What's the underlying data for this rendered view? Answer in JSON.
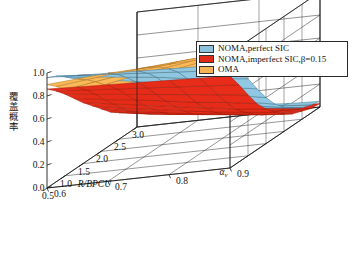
{
  "figure": {
    "background": "#ffffff",
    "axis_color": "#1a1a1a"
  },
  "legend": {
    "position": "top-right",
    "entries": [
      {
        "label": "NOMA,perfect SIC",
        "color": "#8cc2dc"
      },
      {
        "label": "NOMA,imperfect SIC,β=0.15",
        "color": "#e02b18"
      },
      {
        "label": "OMA",
        "color": "#f5b456"
      }
    ]
  },
  "axes": {
    "x": {
      "label": "R/BPCU",
      "ticks": [
        "0.5",
        "1.0",
        "1.5",
        "2.0",
        "2.5",
        "3.0"
      ],
      "values": [
        0.5,
        1.0,
        1.5,
        2.0,
        2.5,
        3.0
      ],
      "range": [
        0.5,
        3.0
      ]
    },
    "y": {
      "label": "α",
      "sublabel": "v",
      "ticks": [
        "0.6",
        "0.7",
        "0.8",
        "0.9"
      ],
      "values": [
        0.6,
        0.7,
        0.8,
        0.9
      ],
      "range": [
        0.6,
        0.9
      ]
    },
    "z": {
      "label": "覆盖概率",
      "ticks": [
        "0.0",
        "0.2",
        "0.4",
        "0.6",
        "0.8",
        "1.0"
      ],
      "values": [
        0.0,
        0.2,
        0.4,
        0.6,
        0.8,
        1.0
      ],
      "range": [
        0.0,
        1.0
      ]
    }
  },
  "chart_data": {
    "type": "surface3d",
    "title": "",
    "xlabel": "R/BPCU",
    "ylabel": "α_v",
    "zlabel": "覆盖概率",
    "xlim": [
      0.5,
      3.0
    ],
    "ylim": [
      0.6,
      0.9
    ],
    "zlim": [
      0.0,
      1.0
    ],
    "grid": true,
    "legend_position": "top-right",
    "x": [
      0.5,
      0.75,
      1.0,
      1.25,
      1.5,
      1.75,
      2.0,
      2.25,
      2.5,
      2.75,
      3.0
    ],
    "y": [
      0.6,
      0.65,
      0.7,
      0.75,
      0.8,
      0.85,
      0.9
    ],
    "series": [
      {
        "name": "NOMA,perfect SIC",
        "color": "#8cc2dc",
        "edge": "#3d6f88",
        "z": [
          [
            0.96,
            0.95,
            0.94,
            0.93,
            0.92,
            0.91,
            0.9
          ],
          [
            0.92,
            0.9,
            0.88,
            0.86,
            0.84,
            0.82,
            0.8
          ],
          [
            0.86,
            0.83,
            0.8,
            0.77,
            0.73,
            0.7,
            0.67
          ],
          [
            0.79,
            0.75,
            0.71,
            0.66,
            0.62,
            0.57,
            0.53
          ],
          [
            0.71,
            0.66,
            0.61,
            0.55,
            0.5,
            0.45,
            0.4
          ],
          [
            0.63,
            0.57,
            0.51,
            0.45,
            0.39,
            0.34,
            0.29
          ],
          [
            0.54,
            0.48,
            0.42,
            0.36,
            0.3,
            0.25,
            0.21
          ],
          [
            0.46,
            0.4,
            0.34,
            0.28,
            0.23,
            0.18,
            0.15
          ],
          [
            0.38,
            0.32,
            0.26,
            0.21,
            0.17,
            0.13,
            0.1
          ],
          [
            0.31,
            0.25,
            0.2,
            0.16,
            0.12,
            0.09,
            0.07
          ],
          [
            0.25,
            0.2,
            0.15,
            0.11,
            0.08,
            0.06,
            0.05
          ]
        ]
      },
      {
        "name": "NOMA,imperfect SIC,β=0.15",
        "color": "#e02b18",
        "edge": "#9c1a0c",
        "z": [
          [
            0.86,
            0.85,
            0.84,
            0.83,
            0.82,
            0.81,
            0.8
          ],
          [
            0.79,
            0.77,
            0.75,
            0.73,
            0.71,
            0.69,
            0.67
          ],
          [
            0.71,
            0.68,
            0.65,
            0.62,
            0.59,
            0.56,
            0.53
          ],
          [
            0.62,
            0.58,
            0.55,
            0.51,
            0.47,
            0.44,
            0.4
          ],
          [
            0.53,
            0.49,
            0.45,
            0.41,
            0.37,
            0.33,
            0.3
          ],
          [
            0.45,
            0.4,
            0.36,
            0.32,
            0.28,
            0.25,
            0.22
          ],
          [
            0.37,
            0.32,
            0.28,
            0.24,
            0.21,
            0.18,
            0.15
          ],
          [
            0.29,
            0.25,
            0.21,
            0.18,
            0.15,
            0.12,
            0.1
          ],
          [
            0.23,
            0.19,
            0.16,
            0.13,
            0.1,
            0.08,
            0.07
          ],
          [
            0.18,
            0.14,
            0.11,
            0.09,
            0.07,
            0.05,
            0.04
          ],
          [
            0.13,
            0.1,
            0.08,
            0.06,
            0.05,
            0.04,
            0.03
          ]
        ]
      },
      {
        "name": "OMA",
        "color": "#f5b456",
        "edge": "#a9701d",
        "z": [
          [
            0.9,
            0.92,
            0.94,
            0.95,
            0.96,
            0.97,
            0.98
          ],
          [
            0.83,
            0.86,
            0.89,
            0.91,
            0.93,
            0.95,
            0.96
          ],
          [
            0.75,
            0.79,
            0.83,
            0.86,
            0.89,
            0.91,
            0.93
          ],
          [
            0.67,
            0.71,
            0.76,
            0.8,
            0.84,
            0.87,
            0.9
          ],
          [
            0.58,
            0.63,
            0.68,
            0.73,
            0.78,
            0.82,
            0.86
          ],
          [
            0.5,
            0.55,
            0.61,
            0.66,
            0.71,
            0.76,
            0.81
          ],
          [
            0.42,
            0.47,
            0.53,
            0.59,
            0.65,
            0.7,
            0.75
          ],
          [
            0.35,
            0.4,
            0.46,
            0.52,
            0.58,
            0.64,
            0.69
          ],
          [
            0.29,
            0.34,
            0.39,
            0.45,
            0.51,
            0.57,
            0.63
          ],
          [
            0.24,
            0.28,
            0.33,
            0.39,
            0.45,
            0.51,
            0.57
          ],
          [
            0.19,
            0.23,
            0.28,
            0.33,
            0.39,
            0.45,
            0.51
          ]
        ]
      }
    ]
  }
}
